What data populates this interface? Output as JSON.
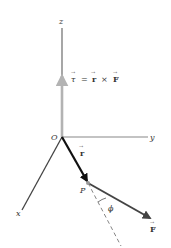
{
  "figure": {
    "axes": {
      "x_label": "x",
      "y_label": "y",
      "z_label": "z",
      "origin_label": "O"
    },
    "vectors": {
      "torque": {
        "symbol": "τ",
        "equation_lhs": "τ",
        "equals": "=",
        "r": "r",
        "times": "×",
        "F": "F",
        "color": "#b3b3b3"
      },
      "position": {
        "symbol": "r",
        "color": "#111111"
      },
      "force": {
        "symbol": "F",
        "color": "#444444"
      }
    },
    "point_label": "P",
    "angle_label": "ϕ",
    "arrow_overbar": "→"
  }
}
